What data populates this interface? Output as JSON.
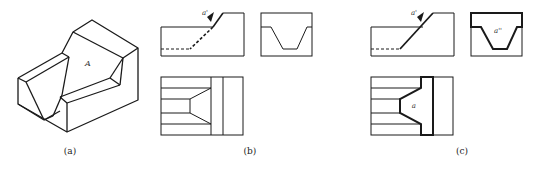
{
  "figure": {
    "panels": [
      {
        "id": "a",
        "caption": "(a)",
        "kind": "isometric-view",
        "labels": {
          "surface": "A"
        }
      },
      {
        "id": "b",
        "caption": "(b)",
        "kind": "three-view-drawing",
        "labels": {
          "front_projection": "a'"
        },
        "views": [
          "front-view",
          "side-view",
          "top-view"
        ]
      },
      {
        "id": "c",
        "caption": "(c)",
        "kind": "three-view-drawing-highlighted",
        "labels": {
          "front_projection": "a'",
          "side_projection": "a''",
          "top_projection": "a"
        },
        "views": [
          "front-view",
          "side-view",
          "top-view"
        ]
      }
    ],
    "colors": {
      "line": "#1a1a1a",
      "background": "#ffffff"
    }
  }
}
